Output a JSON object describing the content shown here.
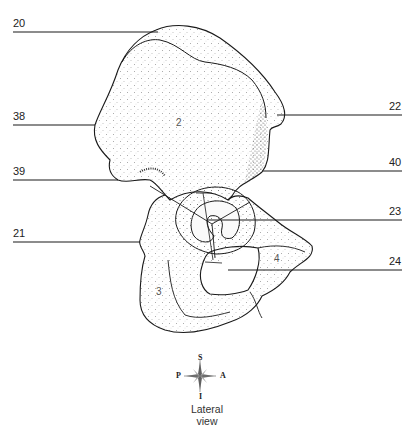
{
  "diagram": {
    "view_caption": {
      "line1": "Lateral",
      "line2": "view"
    },
    "compass": {
      "superior": "S",
      "inferior": "I",
      "posterior": "P",
      "anterior": "A"
    },
    "leader_labels": [
      {
        "id": "20",
        "text": "20",
        "side": "left",
        "y": 32
      },
      {
        "id": "38",
        "text": "38",
        "side": "left",
        "y": 125
      },
      {
        "id": "39",
        "text": "39",
        "side": "left",
        "y": 180
      },
      {
        "id": "21",
        "text": "21",
        "side": "left",
        "y": 242
      },
      {
        "id": "22",
        "text": "22",
        "side": "right",
        "y": 115
      },
      {
        "id": "40",
        "text": "40",
        "side": "right",
        "y": 171
      },
      {
        "id": "23",
        "text": "23",
        "side": "right",
        "y": 220
      },
      {
        "id": "24",
        "text": "24",
        "side": "right",
        "y": 270
      }
    ],
    "region_labels": [
      {
        "id": "region-2",
        "text": "2",
        "part": "ilium"
      },
      {
        "id": "region-3",
        "text": "3",
        "part": "ischium"
      },
      {
        "id": "region-4",
        "text": "4",
        "part": "pubis"
      }
    ],
    "colors": {
      "line": "#1a1a1a",
      "stipple": "#3a3a3a",
      "background": "#ffffff"
    }
  }
}
